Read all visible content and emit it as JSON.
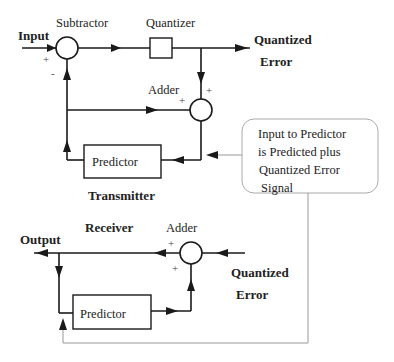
{
  "transmitter": {
    "title": "Transmitter",
    "input_label": "Input",
    "subtractor_label": "Subtractor",
    "quantizer_label": "Quantizer",
    "output_label_line1": "Quantized",
    "output_label_line2": "Error",
    "adder_label": "Adder",
    "predictor_label": "Predictor",
    "subtractor_plus": "+",
    "subtractor_minus": "-",
    "adder_plus_top": "+",
    "adder_plus_left": "+"
  },
  "receiver": {
    "title": "Receiver",
    "output_label": "Output",
    "adder_label": "Adder",
    "input_label_line1": "Quantized",
    "input_label_line2": "Error",
    "predictor_label": "Predictor",
    "adder_plus_top": "+",
    "adder_plus_bottom": "+"
  },
  "note": {
    "line1": "Input to Predictor",
    "line2": "is Predicted plus",
    "line3": "Quantized Error",
    "line4": "Signal"
  }
}
